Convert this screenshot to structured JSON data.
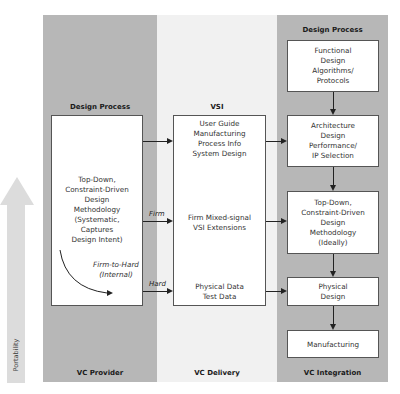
{
  "columns": {
    "provider": {
      "footer": "VC Provider",
      "header": "Design Process"
    },
    "delivery": {
      "footer": "VC Delivery",
      "header": "VSI"
    },
    "integration": {
      "footer": "VC Integration",
      "header": "Design Process"
    }
  },
  "provider_box": {
    "lines": [
      "Top-Down,",
      "Constraint-Driven",
      "Design",
      "Methodology",
      "(Systematic,",
      "Captures",
      "Design Intent)"
    ],
    "internal_label": [
      "Firm-to-Hard",
      "(Internal)"
    ]
  },
  "delivery_box": {
    "group1": [
      "User Guide",
      "Manufacturing",
      "Process Info",
      "System Design"
    ],
    "group2": [
      "Firm Mixed-signal",
      "VSI Extensions"
    ],
    "group3": [
      "Physical Data",
      "Test Data"
    ]
  },
  "arrow_labels": {
    "firm": "Firm",
    "hard": "Hard"
  },
  "integration_boxes": [
    {
      "lines": [
        "Functional",
        "Design",
        "Algorithms/",
        "Protocols"
      ]
    },
    {
      "lines": [
        "Architecture",
        "Design",
        "Performance/",
        "IP Selection"
      ]
    },
    {
      "lines": [
        "Top-Down,",
        "Constraint-Driven",
        "Design",
        "Methodology",
        "(Ideally)"
      ]
    },
    {
      "lines": [
        "Physical",
        "Design"
      ]
    },
    {
      "lines": [
        "Manufacturing"
      ]
    }
  ],
  "portability": {
    "label": "Portability"
  }
}
